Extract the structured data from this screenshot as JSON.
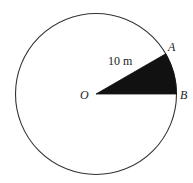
{
  "diagram": {
    "type": "circle-sector",
    "circle": {
      "center_label": "O",
      "radius_label": "10 m"
    },
    "points": [
      {
        "label": "O",
        "role": "center"
      },
      {
        "label": "A",
        "role": "point-on-circle"
      },
      {
        "label": "B",
        "role": "point-on-circle"
      }
    ],
    "shaded_region": "sector AOB",
    "colors": {
      "stroke": "#333333",
      "fill": "#111111",
      "background": "#ffffff"
    }
  },
  "labels": {
    "O": "O",
    "A": "A",
    "B": "B",
    "radius": "10 m"
  }
}
